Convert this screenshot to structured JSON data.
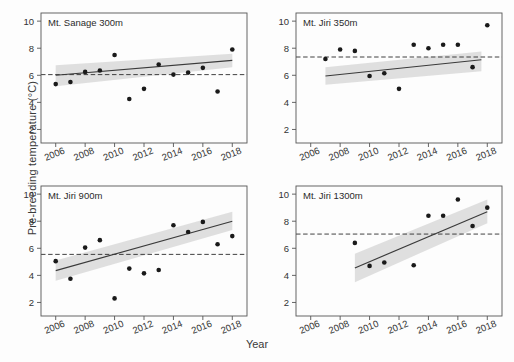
{
  "chart_data": {
    "type": "scatter",
    "title": "",
    "xlabel": "Year",
    "ylabel": "Pre-breeding temperature (°C)",
    "xlim": [
      2005,
      2019
    ],
    "ylim": [
      1,
      10.6
    ],
    "xticks": [
      2006,
      2008,
      2010,
      2012,
      2014,
      2016,
      2018
    ],
    "yticks": [
      2,
      4,
      6,
      8,
      10
    ],
    "grid": false,
    "legend": "none",
    "panel_layout": "2x2",
    "panels": [
      {
        "id": "mt-sanage-300m",
        "label": "Mt. Sanage  300m",
        "position": "top-left",
        "reference_line": 6.05,
        "x": [
          2006,
          2007,
          2008,
          2009,
          2010,
          2011,
          2012,
          2013,
          2014,
          2015,
          2016,
          2017,
          2018
        ],
        "y": [
          5.35,
          5.5,
          6.25,
          6.35,
          7.5,
          4.25,
          5.0,
          6.8,
          6.05,
          6.2,
          6.55,
          4.8,
          7.9
        ],
        "trend": {
          "x_start": 2006,
          "y_start": 6.0,
          "x_end": 2018,
          "y_end": 7.1
        },
        "ci_band": {
          "x_start": 2006,
          "x_end": 2018,
          "upper_start": 6.75,
          "upper_end": 7.6,
          "lower_start": 5.2,
          "lower_end": 6.6
        }
      },
      {
        "id": "mt-jiri-350m",
        "label": "Mt. Jiri 350m",
        "position": "top-right",
        "reference_line": 7.35,
        "x": [
          2007,
          2008,
          2009,
          2010,
          2011,
          2012,
          2013,
          2014,
          2015,
          2016,
          2017,
          2018
        ],
        "y": [
          7.2,
          7.9,
          7.8,
          5.95,
          6.15,
          5.0,
          8.25,
          8.0,
          8.25,
          8.25,
          6.6,
          9.7
        ],
        "trend": {
          "x_start": 2007,
          "y_start": 5.95,
          "x_end": 2017.6,
          "y_end": 7.15
        },
        "ci_band": {
          "x_start": 2007,
          "x_end": 2017.6,
          "upper_start": 6.6,
          "upper_end": 7.75,
          "lower_start": 5.3,
          "lower_end": 6.3
        }
      },
      {
        "id": "mt-jiri-900m",
        "label": "Mt. Jiri 900m",
        "position": "bottom-left",
        "reference_line": 5.55,
        "x": [
          2006,
          2007,
          2008,
          2009,
          2010,
          2011,
          2012,
          2013,
          2014,
          2015,
          2016,
          2017,
          2018
        ],
        "y": [
          5.05,
          3.75,
          6.05,
          6.6,
          2.3,
          4.5,
          4.15,
          4.4,
          7.7,
          7.2,
          7.95,
          6.3,
          6.9
        ],
        "trend": {
          "x_start": 2006,
          "y_start": 4.35,
          "x_end": 2018,
          "y_end": 8.0
        },
        "ci_band": {
          "x_start": 2006,
          "x_end": 2018,
          "upper_start": 5.1,
          "upper_end": 8.7,
          "lower_start": 3.6,
          "lower_end": 7.35
        }
      },
      {
        "id": "mt-jiri-1300m",
        "label": "Mt. Jiri 1300m",
        "position": "bottom-right",
        "reference_line": 7.05,
        "x": [
          2009,
          2010,
          2011,
          2013,
          2014,
          2015,
          2016,
          2017,
          2018
        ],
        "y": [
          6.4,
          4.7,
          4.95,
          4.75,
          8.4,
          8.4,
          9.6,
          7.65,
          9.0
        ],
        "trend": {
          "x_start": 2009,
          "y_start": 4.55,
          "x_end": 2018,
          "y_end": 8.7
        },
        "ci_band": {
          "x_start": 2009,
          "x_end": 2018,
          "upper_start": 5.6,
          "upper_end": 9.6,
          "lower_start": 3.5,
          "lower_end": 7.85
        }
      }
    ],
    "style": {
      "point_color": "#1a1a1a",
      "trend_color": "#3a3a3a",
      "band_color": "#d9d9d9",
      "reference_color": "#2b2b2b",
      "axis_color": "#555555",
      "background": "#fdfdfd"
    }
  },
  "axes": {
    "y_title": "Pre-breeding temperature (°C)",
    "x_title": "Year"
  }
}
